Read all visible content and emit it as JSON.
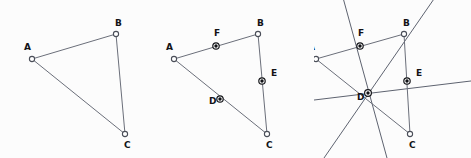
{
  "figure": {
    "panel_count": 3,
    "background_color": "#fcfcfc",
    "edge_color": "#6b6f7a",
    "bisector_color": "#5e6370",
    "vertex_fill": "#ffffff",
    "vertex_stroke": "#4a4e58",
    "midpoint_fill": "#111216",
    "label_color": "#121317"
  },
  "panels": [
    {
      "id": "panel-1",
      "name": "triangle-only",
      "caption": "",
      "vertices": [
        {
          "label": "A",
          "x": 32,
          "y": 59,
          "label_x": 24,
          "label_y": 50
        },
        {
          "label": "B",
          "x": 116,
          "y": 34,
          "label_x": 115,
          "label_y": 26
        },
        {
          "label": "C",
          "x": 125,
          "y": 134,
          "label_x": 124,
          "label_y": 148
        }
      ],
      "edges": [
        {
          "name": "side-AB",
          "from": "A",
          "to": "B"
        },
        {
          "name": "side-BC",
          "from": "B",
          "to": "C"
        },
        {
          "name": "side-CA",
          "from": "C",
          "to": "A"
        }
      ],
      "midpoints": [],
      "bisectors": []
    },
    {
      "id": "panel-2",
      "name": "triangle-with-midpoints",
      "caption": "",
      "vertices": [
        {
          "label": "A",
          "x": 17,
          "y": 59,
          "label_x": 9,
          "label_y": 50
        },
        {
          "label": "B",
          "x": 101,
          "y": 34,
          "label_x": 100,
          "label_y": 26
        },
        {
          "label": "C",
          "x": 110,
          "y": 134,
          "label_x": 109,
          "label_y": 148
        }
      ],
      "edges": [
        {
          "name": "side-AB",
          "from": "A",
          "to": "B"
        },
        {
          "name": "side-BC",
          "from": "B",
          "to": "C"
        },
        {
          "name": "side-CA",
          "from": "C",
          "to": "A"
        }
      ],
      "midpoints": [
        {
          "label": "F",
          "of": "AB",
          "x": 59,
          "y": 46,
          "label_x": 57,
          "label_y": 36
        },
        {
          "label": "E",
          "of": "BC",
          "x": 105,
          "y": 81,
          "label_x": 114,
          "label_y": 76
        },
        {
          "label": "D",
          "of": "CA",
          "x": 63,
          "y": 99,
          "label_x": 52,
          "label_y": 104
        }
      ],
      "bisectors": []
    },
    {
      "id": "panel-3",
      "name": "triangle-with-perpendicular-bisectors",
      "caption": "",
      "vertices": [
        {
          "label": "A",
          "x": 2,
          "y": 59,
          "label_x": -6,
          "label_y": 50
        },
        {
          "label": "B",
          "x": 90,
          "y": 34,
          "label_x": 89,
          "label_y": 26
        },
        {
          "label": "C",
          "x": 96,
          "y": 134,
          "label_x": 95,
          "label_y": 148
        }
      ],
      "edges": [
        {
          "name": "side-AB",
          "from": "A",
          "to": "B"
        },
        {
          "name": "side-BC",
          "from": "B",
          "to": "C"
        },
        {
          "name": "side-CA",
          "from": "C",
          "to": "A"
        }
      ],
      "midpoints": [
        {
          "label": "F",
          "of": "AB",
          "x": 46,
          "y": 46,
          "label_x": 44,
          "label_y": 36
        },
        {
          "label": "E",
          "of": "BC",
          "x": 93,
          "y": 81,
          "label_x": 102,
          "label_y": 76
        },
        {
          "label": "D",
          "of": "CA",
          "x": 54,
          "y": 93,
          "label_x": 43,
          "label_y": 100
        }
      ],
      "circumcenter": {
        "label": "",
        "x": 54,
        "y": 93
      },
      "bisectors": [
        {
          "name": "bisector-of-AB",
          "through": "F",
          "x1": 28,
          "y1": -6,
          "x2": 73,
          "y2": 158
        },
        {
          "name": "bisector-of-BC",
          "through": "E",
          "x1": -8,
          "y1": 101,
          "x2": 157,
          "y2": 81
        },
        {
          "name": "bisector-of-CA",
          "through": "D",
          "x1": 122,
          "y1": -4,
          "x2": 10,
          "y2": 158
        }
      ]
    }
  ],
  "legend": {
    "vertex_marker": "open-circle",
    "midpoint_marker": "filled-circle-with-ring",
    "labels": [
      "A",
      "B",
      "C",
      "D",
      "E",
      "F"
    ]
  }
}
